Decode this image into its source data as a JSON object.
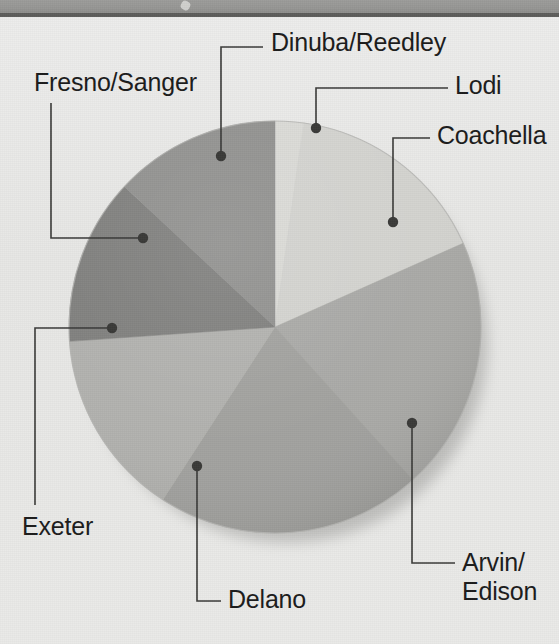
{
  "figure": {
    "type": "pie-chart",
    "top_band_color": "#969694",
    "background_color": "#e8e8e6"
  },
  "labels": [
    {
      "key": "dinuba_reedley",
      "text": "Dinuba/Reedley"
    },
    {
      "key": "fresno_sanger",
      "text": "Fresno/Sanger"
    },
    {
      "key": "lodi",
      "text": "Lodi"
    },
    {
      "key": "coachella",
      "text": "Coachella"
    },
    {
      "key": "exeter",
      "text": "Exeter"
    },
    {
      "key": "delano",
      "text": "Delano"
    },
    {
      "key": "arvin_edison_1",
      "text": "Arvin/"
    },
    {
      "key": "arvin_edison_2",
      "text": "Edison"
    }
  ],
  "chart_data": {
    "type": "pie",
    "title": "",
    "xlabel": "",
    "ylabel": "",
    "legend_position": "callout-labels",
    "grid": false,
    "categories": [
      "Lodi",
      "Coachella",
      "Arvin/Edison",
      "Delano",
      "Exeter",
      "Fresno/Sanger",
      "Dinuba/Reedley"
    ],
    "values": [
      2,
      16,
      20,
      21,
      15,
      13,
      13
    ],
    "unit": "percent",
    "slice_colors": [
      "#d9d9d5",
      "#d2d2ce",
      "#a8a8a5",
      "#a0a09d",
      "#b0b0ad",
      "#7e7e7c",
      "#8f8f8d"
    ],
    "slices": [
      {
        "label": "Lodi",
        "value": 2,
        "start_deg": 0,
        "end_deg": 8,
        "color": "#d9d9d5",
        "dot": [
          316,
          128
        ]
      },
      {
        "label": "Coachella",
        "value": 16,
        "start_deg": 8,
        "end_deg": 66,
        "color": "#d2d2ce",
        "dot": [
          393,
          222
        ]
      },
      {
        "label": "Arvin/Edison",
        "value": 20,
        "start_deg": 66,
        "end_deg": 138,
        "color": "#a8a8a5",
        "dot": [
          412,
          423
        ]
      },
      {
        "label": "Delano",
        "value": 21,
        "start_deg": 138,
        "end_deg": 213,
        "color": "#a0a09d",
        "dot": [
          197,
          466
        ]
      },
      {
        "label": "Exeter",
        "value": 15,
        "start_deg": 213,
        "end_deg": 266,
        "color": "#b0b0ad",
        "dot": [
          112,
          328
        ]
      },
      {
        "label": "Fresno/Sanger",
        "value": 13,
        "start_deg": 266,
        "end_deg": 313,
        "color": "#7e7e7c",
        "dot": [
          143,
          238
        ]
      },
      {
        "label": "Dinuba/Reedley",
        "value": 13,
        "start_deg": 313,
        "end_deg": 360,
        "color": "#8f8f8d",
        "dot": [
          221,
          156
        ]
      }
    ]
  }
}
